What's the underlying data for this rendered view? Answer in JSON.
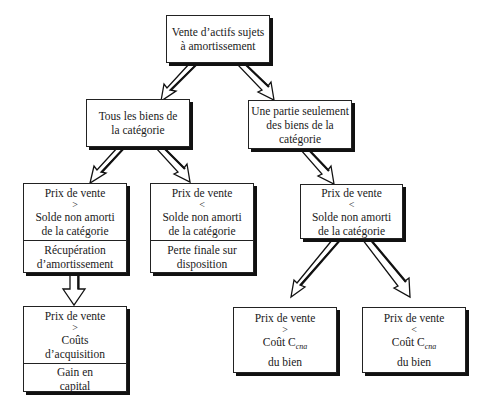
{
  "diagram": {
    "type": "flowchart",
    "root": {
      "lines": [
        "Vente d’actifs sujets",
        "à amortissement"
      ]
    },
    "level2": {
      "all_assets": {
        "lines": [
          "Tous les biens de",
          "la catégorie"
        ]
      },
      "part_assets": {
        "lines": [
          "Une partie seulement",
          "des biens de la",
          "catégorie"
        ]
      }
    },
    "level3": {
      "price_gt_balance": {
        "condition": [
          "Prix de vente",
          ">",
          "Solde non amorti",
          "de la catégorie"
        ],
        "result": [
          "Récupération",
          "d’amortissement"
        ]
      },
      "price_lt_balance": {
        "condition": [
          "Prix de vente",
          "<",
          "Solde non amorti",
          "de la catégorie"
        ],
        "result": [
          "Perte finale sur",
          "disposition"
        ]
      },
      "part_price_lt_balance": {
        "condition": [
          "Prix de vente",
          "<",
          "Solde non amorti",
          "de la catégorie"
        ]
      }
    },
    "level4": {
      "price_gt_acquisition": {
        "condition": [
          "Prix de vente",
          ">",
          "Coûts",
          "d’acquisition"
        ],
        "result": [
          "Gain en",
          "capital"
        ]
      },
      "price_gt_cost": {
        "condition": [
          "Prix de vente",
          ">",
          "Coût C",
          "cna",
          "du bien"
        ]
      },
      "price_lt_cost": {
        "condition": [
          "Prix de vente",
          "<",
          "Coût C",
          "cna",
          "du bien"
        ]
      }
    },
    "edges": [
      {
        "from": "root",
        "to": "all_assets"
      },
      {
        "from": "root",
        "to": "part_assets"
      },
      {
        "from": "all_assets",
        "to": "price_gt_balance"
      },
      {
        "from": "all_assets",
        "to": "price_lt_balance"
      },
      {
        "from": "part_assets",
        "to": "part_price_lt_balance"
      },
      {
        "from": "price_gt_balance",
        "to": "price_gt_acquisition"
      },
      {
        "from": "part_price_lt_balance",
        "to": "price_gt_cost"
      },
      {
        "from": "part_price_lt_balance",
        "to": "price_lt_cost"
      }
    ]
  }
}
